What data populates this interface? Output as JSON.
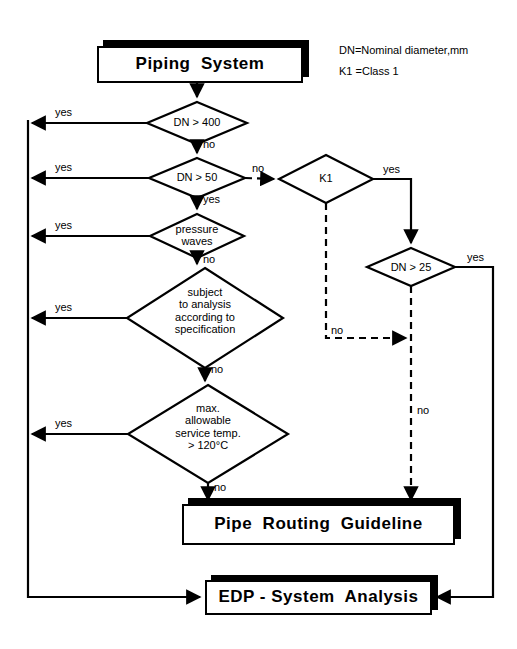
{
  "diagram": {
    "stroke_color": "#000000",
    "background_color": "#ffffff"
  },
  "legend": {
    "line1": "DN=Nominal diameter,mm",
    "line2": "K1 =Class 1"
  },
  "boxes": {
    "start": "Piping  System",
    "routing": "Pipe  Routing  Guideline",
    "edp": "EDP - System  Analysis"
  },
  "decisions": {
    "dn400": "DN > 400",
    "dn50": "DN > 50",
    "k1": "K1",
    "pressure_waves": "pressure\nwaves",
    "dn25": "DN > 25",
    "subject_analysis": "subject\nto analysis\naccording to\nspecification",
    "max_temp": "max.\nallowable\nservice temp.\n> 120°C"
  },
  "edge_labels": {
    "dn400_yes": "yes",
    "dn400_no": "no",
    "dn50_yes_left": "yes",
    "dn50_no_right": "no",
    "dn50_yes_down": "yes",
    "k1_yes": "yes",
    "k1_no": "no",
    "pressure_yes": "yes",
    "pressure_no": "no",
    "dn25_yes": "yes",
    "dn25_no": "no",
    "subject_yes": "yes",
    "subject_no": "no",
    "temp_yes": "yes",
    "temp_no": "no"
  }
}
